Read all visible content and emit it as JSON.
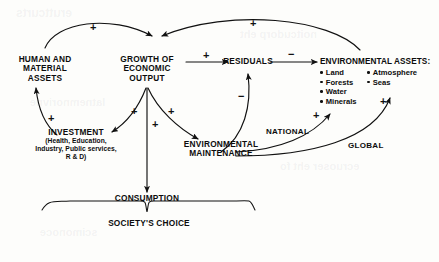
{
  "diagram": {
    "nodes": {
      "human_assets": "HUMAN AND\nMATERIAL\nASSETS",
      "growth": "GROWTH OF\nECONOMIC\nOUTPUT",
      "residuals": "RESIDUALS",
      "investment_title": "INVESTMENT",
      "investment_detail_1": "(Health, Education,",
      "investment_detail_2": "Industry, Public services,",
      "investment_detail_3": "R & D)",
      "env_maintenance": "ENVIRONMENTAL\nMAINTENANCE",
      "consumption": "CONSUMPTION",
      "societys_choice": "SOCIETY'S CHOICE"
    },
    "environmental_assets": {
      "title": "ENVIRONMENTAL ASSETS:",
      "column_left": [
        "Land",
        "Forests",
        "Water",
        "Minerals"
      ],
      "column_right": [
        "Atmosphere",
        "Seas"
      ]
    },
    "edge_labels": {
      "national": "NATIONAL",
      "global": "GLOBAL"
    },
    "signs": {
      "human_to_growth": "+",
      "assets_to_growth": "+",
      "growth_to_residuals": "+",
      "residuals_to_assets": "−",
      "maintenance_to_residuals": "−",
      "growth_to_investment": "+",
      "growth_to_consumption": "+",
      "growth_to_maintenance": "+",
      "investment_to_human": "+",
      "national_to_assets": "+",
      "global_to_assets": "+"
    },
    "colors": {
      "ink": "#0c0c0c",
      "paper": "#fdfdfb"
    }
  }
}
